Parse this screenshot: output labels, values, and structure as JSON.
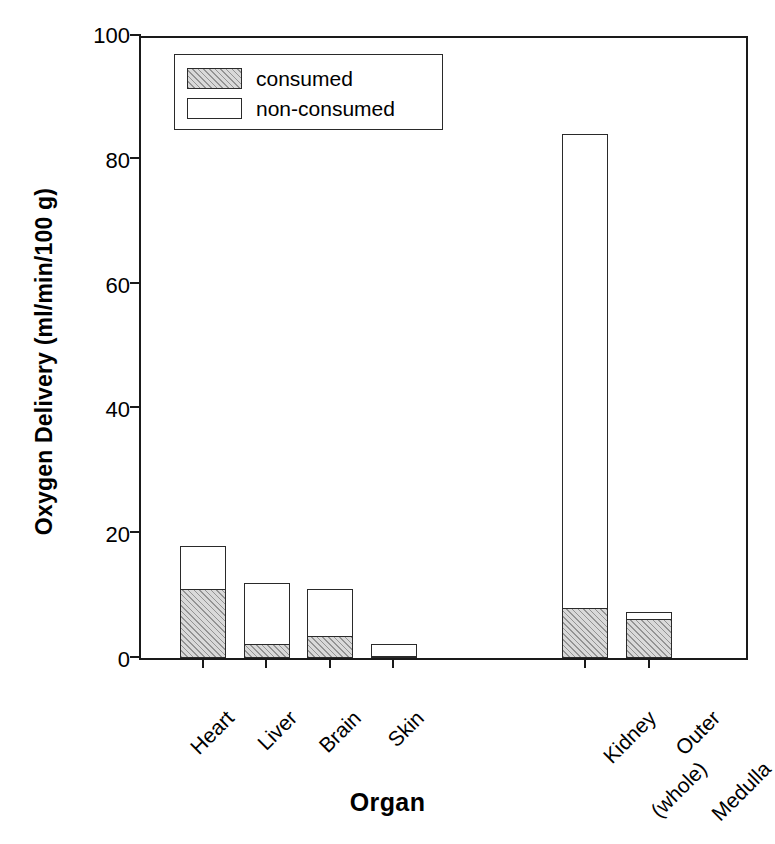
{
  "chart_data": {
    "type": "bar",
    "subtype": "stacked",
    "title": "",
    "xlabel": "Organ",
    "ylabel": "Oxygen Delivery (ml/min/100 g)",
    "categories": [
      "Heart",
      "Liver",
      "Brain",
      "Skin",
      "Kidney\n(whole)",
      "Outer\nMedulla"
    ],
    "category_labels": [
      {
        "line1": "Heart",
        "line2": ""
      },
      {
        "line1": "Liver",
        "line2": ""
      },
      {
        "line1": "Brain",
        "line2": ""
      },
      {
        "line1": "Skin",
        "line2": ""
      },
      {
        "line1": "Kidney",
        "line2": "(whole)"
      },
      {
        "line1": "Outer",
        "line2": "Medulla"
      }
    ],
    "series": [
      {
        "name": "consumed",
        "values": [
          11.0,
          2.2,
          3.5,
          0.3,
          8.0,
          6.2
        ]
      },
      {
        "name": "non-consumed",
        "values": [
          7.0,
          9.8,
          7.5,
          1.9,
          76.0,
          1.1
        ]
      }
    ],
    "totals": [
      18.0,
      12.0,
      11.0,
      2.2,
      84.0,
      7.3
    ],
    "ylim": [
      0,
      100
    ],
    "yticks": [
      0,
      20,
      40,
      60,
      80,
      100
    ],
    "ytick_labels": [
      "0",
      "20",
      "40",
      "60",
      "80",
      "100"
    ],
    "grid": false,
    "legend_position": "top-left",
    "legend_entries": [
      {
        "label": "consumed",
        "fill": "hatched-gray"
      },
      {
        "label": "non-consumed",
        "fill": "white"
      }
    ],
    "colors": {
      "consumed": "#d9d9d9",
      "non_consumed": "#ffffff",
      "outline": "#2a2a2a",
      "axis": "#1a1a1a",
      "background": "#ffffff"
    }
  }
}
